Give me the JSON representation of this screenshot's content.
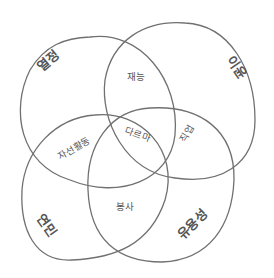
{
  "diagram": {
    "type": "venn",
    "sets": [
      {
        "id": "passion",
        "label": "열정"
      },
      {
        "id": "profit",
        "label": "이윤"
      },
      {
        "id": "love",
        "label": "연민"
      },
      {
        "id": "usefulness",
        "label": "유용성"
      }
    ],
    "intersections": {
      "talent": "재능",
      "charity": "자선활동",
      "center": "다르마",
      "vocation": "직업",
      "service": "봉사"
    },
    "stroke_color": "#707070",
    "text_color": "#555555"
  }
}
